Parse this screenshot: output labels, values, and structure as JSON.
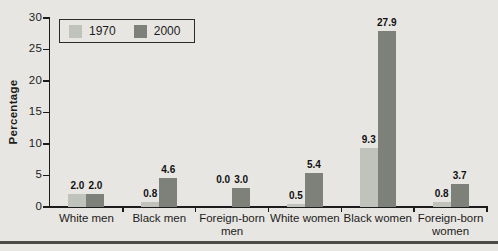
{
  "chart_data": {
    "type": "bar",
    "title": "",
    "categories": [
      "White men",
      "Black men",
      "Foreign-born men",
      "White women",
      "Black women",
      "Foreign-born women"
    ],
    "series": [
      {
        "name": "1970",
        "color": "#c0c2bc",
        "values": [
          2.0,
          0.8,
          0.0,
          0.5,
          9.3,
          0.8
        ]
      },
      {
        "name": "2000",
        "color": "#7e807a",
        "values": [
          2.0,
          4.6,
          3.0,
          5.4,
          27.9,
          3.7
        ]
      }
    ],
    "xlabel": "",
    "ylabel": "Percentage",
    "ylim": [
      0,
      30
    ],
    "yticks": [
      0,
      5,
      10,
      15,
      20,
      25,
      30
    ],
    "grid": false,
    "legend_position": "top-left",
    "value_labels_shown": true
  },
  "colors": {
    "background": "#e8e6e2",
    "axis": "#1c1c1c",
    "text": "#1c1c1c",
    "bar_1970": "#c0c2bc",
    "bar_2000": "#7e807a",
    "bottom_rule": "#4a4a48"
  }
}
